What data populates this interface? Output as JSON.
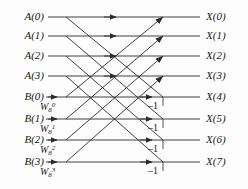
{
  "figure": {
    "width": 248,
    "height": 189,
    "line_color": "#2b2b2b",
    "text_color": "#1a1a1a",
    "background": "#fdfdfd"
  },
  "inputs": [
    {
      "label": "A(0)",
      "y": 17
    },
    {
      "label": "A(1)",
      "y": 36
    },
    {
      "label": "A(2)",
      "y": 56
    },
    {
      "label": "A(3)",
      "y": 76
    },
    {
      "label": "B(0)",
      "y": 97
    },
    {
      "label": "B(1)",
      "y": 119
    },
    {
      "label": "B(2)",
      "y": 140
    },
    {
      "label": "B(3)",
      "y": 162
    }
  ],
  "outputs": [
    {
      "label": "X(0)",
      "y": 17
    },
    {
      "label": "X(1)",
      "y": 36
    },
    {
      "label": "X(2)",
      "y": 56
    },
    {
      "label": "X(3)",
      "y": 76
    },
    {
      "label": "X(4)",
      "y": 97
    },
    {
      "label": "X(5)",
      "y": 119
    },
    {
      "label": "X(6)",
      "y": 140
    },
    {
      "label": "X(7)",
      "y": 162
    }
  ],
  "twiddles": [
    {
      "base": "W",
      "sub": "8",
      "sup": "0",
      "row": 4,
      "y": 97
    },
    {
      "base": "W",
      "sub": "8",
      "sup": "1",
      "row": 5,
      "y": 119
    },
    {
      "base": "W",
      "sub": "8",
      "sup": "2",
      "row": 6,
      "y": 140
    },
    {
      "base": "W",
      "sub": "8",
      "sup": "3",
      "row": 7,
      "y": 162
    }
  ],
  "negative_ones": [
    {
      "label": "–1",
      "row": 4,
      "y": 97
    },
    {
      "label": "–1",
      "row": 5,
      "y": 119
    },
    {
      "label": "–1",
      "row": 6,
      "y": 140
    },
    {
      "label": "–1",
      "row": 7,
      "y": 162
    }
  ],
  "geometry": {
    "line_start_x": 48,
    "line_end_x": 200,
    "node_x": 163,
    "mid_arrow_x": 116,
    "twiddle_arrow_x": 56
  }
}
